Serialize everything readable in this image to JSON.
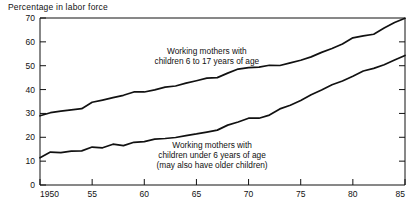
{
  "chart_data": {
    "type": "line",
    "title": "Percentage in labor force",
    "xlabel": "",
    "ylabel": "Percentage in labor force",
    "xlim": [
      1950,
      1985
    ],
    "ylim": [
      0,
      70
    ],
    "grid": false,
    "legend_position": "inline-annotations",
    "y_ticks": [
      "0",
      "10",
      "20",
      "30",
      "40",
      "50",
      "60",
      "70"
    ],
    "y_tick_values": [
      0,
      10,
      20,
      30,
      40,
      50,
      60,
      70
    ],
    "x_ticks": [
      "1950",
      "55",
      "60",
      "65",
      "70",
      "75",
      "80",
      "85"
    ],
    "x_tick_values": [
      1950,
      1955,
      1960,
      1965,
      1970,
      1975,
      1980,
      1985
    ],
    "annotations": [
      {
        "name": "older-children-label",
        "lines": [
          "Working mothers with",
          "children 6 to 17 years of age"
        ],
        "x": 1966.0,
        "y": 55.0
      },
      {
        "name": "young-children-label",
        "lines": [
          "Working mothers with",
          "children under 6 years of age",
          "(may also have older children)"
        ],
        "x": 1966.5,
        "y": 15.5
      }
    ],
    "series": [
      {
        "name": "Working mothers with children 6 to 17 years of age",
        "color": "#111111",
        "x": [
          1950,
          1951,
          1952,
          1953,
          1954,
          1955,
          1956,
          1957,
          1958,
          1959,
          1960,
          1961,
          1962,
          1963,
          1964,
          1965,
          1966,
          1967,
          1968,
          1969,
          1970,
          1971,
          1972,
          1973,
          1974,
          1975,
          1976,
          1977,
          1978,
          1979,
          1980,
          1981,
          1982,
          1983,
          1984,
          1985
        ],
        "values": [
          29.0,
          30.3,
          31.0,
          31.5,
          32.0,
          34.7,
          35.6,
          36.6,
          37.6,
          39.0,
          39.0,
          39.9,
          41.0,
          41.5,
          42.7,
          43.7,
          44.8,
          45.0,
          46.9,
          48.6,
          49.2,
          49.4,
          50.2,
          50.1,
          51.2,
          52.3,
          53.7,
          55.6,
          57.2,
          59.1,
          61.7,
          62.5,
          63.2,
          65.8,
          68.1,
          69.9
        ]
      },
      {
        "name": "Working mothers with children under 6 years of age (may also have older children)",
        "color": "#111111",
        "x": [
          1950,
          1951,
          1952,
          1953,
          1954,
          1955,
          1956,
          1957,
          1958,
          1959,
          1960,
          1961,
          1962,
          1963,
          1964,
          1965,
          1966,
          1967,
          1968,
          1969,
          1970,
          1971,
          1972,
          1973,
          1974,
          1975,
          1976,
          1977,
          1978,
          1979,
          1980,
          1981,
          1982,
          1983,
          1984,
          1985
        ],
        "values": [
          11.4,
          13.8,
          13.6,
          14.2,
          14.3,
          15.9,
          15.6,
          17.1,
          16.5,
          17.9,
          18.2,
          19.2,
          19.5,
          19.9,
          20.7,
          21.4,
          22.2,
          23.0,
          25.1,
          26.4,
          28.0,
          28.0,
          29.3,
          31.9,
          33.4,
          35.4,
          37.8,
          39.8,
          42.0,
          43.6,
          45.6,
          47.8,
          48.9,
          50.4,
          52.4,
          54.3
        ]
      }
    ]
  }
}
